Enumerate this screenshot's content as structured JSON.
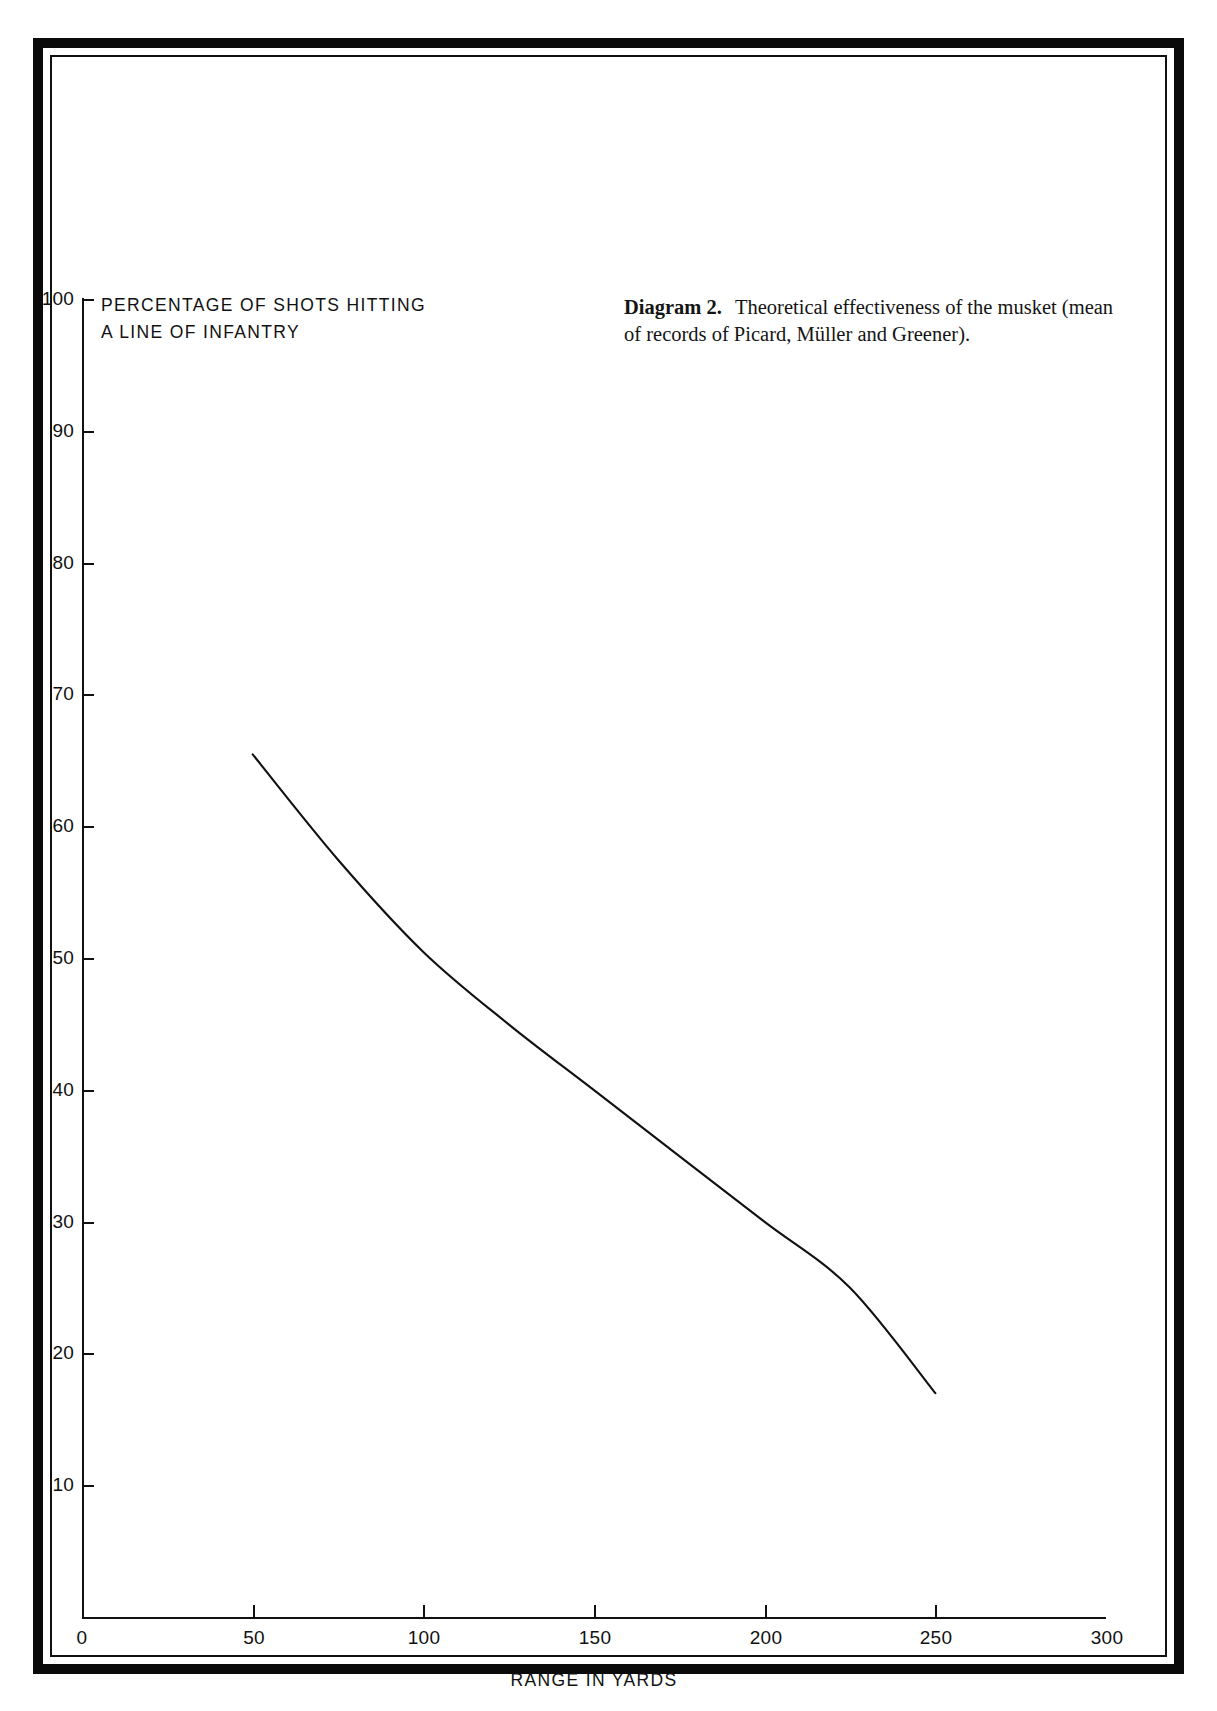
{
  "caption": {
    "label": "Diagram 2.",
    "text": "Theoretical effectiveness of the musket (mean of records of Picard, Müller and Greener)."
  },
  "axes": {
    "y_title_line1": "PERCENTAGE OF SHOTS HITTING",
    "y_title_line2": "A LINE OF INFANTRY",
    "x_title": "RANGE IN YARDS",
    "y_ticks": [
      "100",
      "90",
      "80",
      "70",
      "60",
      "50",
      "40",
      "30",
      "20",
      "10",
      "0"
    ],
    "x_ticks": [
      "0",
      "50",
      "100",
      "150",
      "200",
      "250",
      "300"
    ]
  },
  "chart_data": {
    "type": "line",
    "title": "Theoretical effectiveness of the musket",
    "xlabel": "RANGE IN YARDS",
    "ylabel": "PERCENTAGE OF SHOTS HITTING A LINE OF INFANTRY",
    "xlim": [
      0,
      300
    ],
    "ylim": [
      0,
      100
    ],
    "xticks": [
      0,
      50,
      100,
      150,
      200,
      250,
      300
    ],
    "yticks": [
      0,
      10,
      20,
      30,
      40,
      50,
      60,
      70,
      80,
      90,
      100
    ],
    "grid": false,
    "legend": false,
    "series": [
      {
        "name": "Percentage of shots hitting a line of infantry",
        "x": [
          50,
          75,
          100,
          125,
          150,
          175,
          200,
          225,
          250
        ],
        "values": [
          65.5,
          57.5,
          50.5,
          45.0,
          40.0,
          35.0,
          30.0,
          25.0,
          17.0
        ]
      }
    ]
  },
  "colors": {
    "ink": "#111111",
    "frame": "#0a0a0a",
    "paper": "#ffffff"
  }
}
